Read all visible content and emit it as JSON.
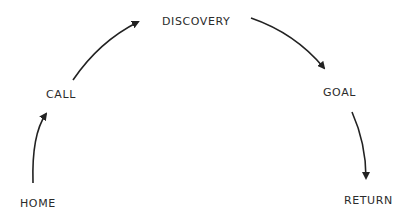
{
  "diagram": {
    "type": "flow-arc",
    "stroke_color": "#222222",
    "label_color": "#2b2b2b",
    "background": "#ffffff",
    "nodes": [
      {
        "id": "home",
        "label": "HOME"
      },
      {
        "id": "call",
        "label": "CALL"
      },
      {
        "id": "discovery",
        "label": "DISCOVERY"
      },
      {
        "id": "goal",
        "label": "GOAL"
      },
      {
        "id": "return",
        "label": "RETURN"
      }
    ],
    "edges": [
      {
        "from": "HOME",
        "to": "CALL"
      },
      {
        "from": "CALL",
        "to": "DISCOVERY"
      },
      {
        "from": "DISCOVERY",
        "to": "GOAL"
      },
      {
        "from": "GOAL",
        "to": "RETURN"
      }
    ]
  }
}
